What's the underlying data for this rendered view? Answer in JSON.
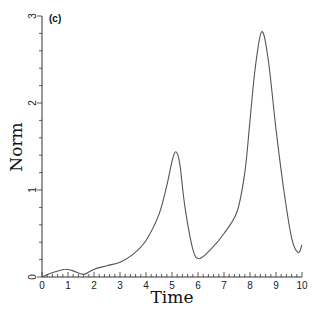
{
  "chart_data": {
    "type": "line",
    "title": "",
    "panel_label": "(c)",
    "xlabel": "Time",
    "ylabel": "Norm",
    "xlim": [
      0,
      10
    ],
    "ylim": [
      0,
      3
    ],
    "x_ticks": [
      "0",
      "1",
      "2",
      "3",
      "4",
      "5",
      "6",
      "7",
      "8",
      "9",
      "10"
    ],
    "y_ticks": [
      "0",
      "1",
      "2",
      "3"
    ],
    "grid": false,
    "legend": null,
    "series": [
      {
        "name": "Norm",
        "color": "#555555",
        "x": [
          0,
          0.5,
          0.9,
          1.2,
          1.6,
          2.0,
          2.5,
          3.0,
          3.5,
          4.0,
          4.5,
          4.8,
          5.0,
          5.15,
          5.3,
          5.5,
          5.8,
          6.05,
          6.5,
          7.0,
          7.5,
          7.8,
          8.0,
          8.2,
          8.45,
          8.7,
          9.0,
          9.3,
          9.6,
          9.85,
          10.0
        ],
        "y": [
          0.0,
          0.06,
          0.09,
          0.07,
          0.03,
          0.09,
          0.13,
          0.17,
          0.26,
          0.42,
          0.72,
          1.05,
          1.33,
          1.44,
          1.3,
          0.8,
          0.32,
          0.21,
          0.32,
          0.5,
          0.75,
          1.2,
          1.8,
          2.4,
          2.82,
          2.5,
          1.7,
          1.0,
          0.45,
          0.28,
          0.37
        ]
      }
    ]
  }
}
